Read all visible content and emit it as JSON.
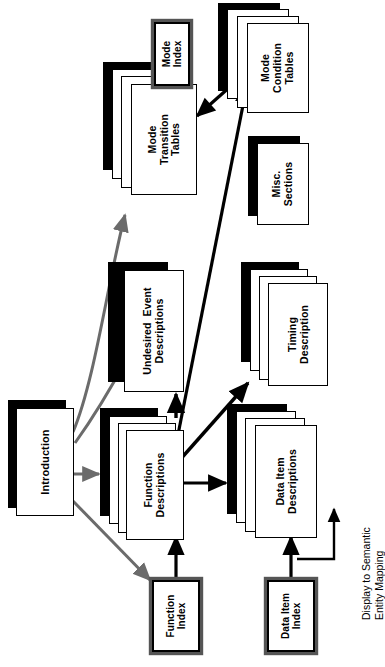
{
  "diagram": {
    "orientation": "rotated-90-ccw",
    "colors": {
      "node_fill": "#ffffff",
      "node_border": "#000000",
      "shadow": "#000000",
      "arrow_black": "#000000",
      "arrow_gray": "#6b6b6b",
      "index_frame": "#555555",
      "background": "#ffffff"
    }
  },
  "nodes": {
    "introduction": {
      "label": "Introduction",
      "type": "single-sheet-shadow",
      "sheets": 1
    },
    "function_descriptions": {
      "label": "Function\nDescriptions",
      "type": "stack-shadow",
      "sheets": 3
    },
    "undesired_events": {
      "label": "Undesired  Event\nDescriptions",
      "type": "single-sheet-shadow",
      "sheets": 1
    },
    "mode_transition_tables": {
      "label": "Mode\nTransition\nTables",
      "type": "stack-shadow",
      "sheets": 3
    },
    "mode_index": {
      "label": "Mode\nIndex",
      "type": "index-box",
      "sheets": 1
    },
    "mode_condition_tables": {
      "label": "Mode\nCondition\nTables",
      "type": "stack-shadow",
      "sheets": 3
    },
    "misc_sections": {
      "label": "Misc.\nSections",
      "type": "single-sheet-shadow",
      "sheets": 1
    },
    "timing_description": {
      "label": "Timing\nDescription",
      "type": "stack-shadow",
      "sheets": 3
    },
    "data_item_descriptions": {
      "label": "Data Item\nDescriptions",
      "type": "stack-shadow",
      "sheets": 3
    },
    "function_index": {
      "label": "Function\nIndex",
      "type": "index-box",
      "sheets": 1
    },
    "data_item_index": {
      "label": "Data Item\nIndex",
      "type": "index-box",
      "sheets": 1
    }
  },
  "annotations": {
    "display_mapping": "Display to Semantic\nEntity Mapping"
  },
  "edges": [
    {
      "id": "intro-to-mode-transition",
      "from": "introduction",
      "to": "mode_transition_tables",
      "style": "gray",
      "heads": 1
    },
    {
      "id": "intro-to-undesired-events",
      "from": "introduction",
      "to": "undesired_events",
      "style": "gray",
      "heads": 1
    },
    {
      "id": "intro-to-function-descriptions",
      "from": "introduction",
      "to": "function_descriptions",
      "style": "gray",
      "heads": 1
    },
    {
      "id": "intro-to-function-index",
      "from": "introduction",
      "to": "function_index",
      "style": "gray",
      "heads": 1
    },
    {
      "id": "mode-index-to-mode-transition",
      "from": "mode_index",
      "to": "mode_transition_tables",
      "style": "black",
      "heads": 1
    },
    {
      "id": "mode-transition-to-mode-condition",
      "from": "mode_transition_tables",
      "to": "mode_condition_tables",
      "style": "black",
      "heads": 2
    },
    {
      "id": "function-to-mode-condition",
      "from": "function_descriptions",
      "to": "mode_condition_tables",
      "style": "black",
      "heads": 1
    },
    {
      "id": "function-to-undesired-events",
      "from": "function_descriptions",
      "to": "undesired_events",
      "style": "black",
      "heads": 1
    },
    {
      "id": "function-to-timing",
      "from": "function_descriptions",
      "to": "timing_description",
      "style": "black",
      "heads": 1
    },
    {
      "id": "function-to-data-item",
      "from": "function_descriptions",
      "to": "data_item_descriptions",
      "style": "black",
      "heads": 1
    },
    {
      "id": "function-index-to-function",
      "from": "function_index",
      "to": "function_descriptions",
      "style": "black",
      "heads": 1
    },
    {
      "id": "data-item-index-to-data-item",
      "from": "data_item_index",
      "to": "data_item_descriptions",
      "style": "black",
      "heads": 1
    },
    {
      "id": "display-mapping-loop",
      "from": "data_item_descriptions",
      "to": "data_item_descriptions",
      "style": "black",
      "heads": 1
    }
  ]
}
